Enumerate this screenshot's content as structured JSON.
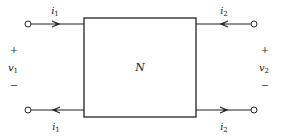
{
  "diagram": {
    "network_label": "N",
    "left_port": {
      "voltage": "v",
      "voltage_sub": "1",
      "plus": "+",
      "minus": "−",
      "current_top": "i",
      "current_top_sub": "1",
      "current_bottom": "i",
      "current_bottom_sub": "1"
    },
    "right_port": {
      "voltage": "v",
      "voltage_sub": "2",
      "plus": "+",
      "minus": "−",
      "current_top": "i",
      "current_top_sub": "2",
      "current_bottom": "i",
      "current_bottom_sub": "2"
    },
    "colors": {
      "line": "#222222",
      "background": "#ffffff"
    }
  }
}
